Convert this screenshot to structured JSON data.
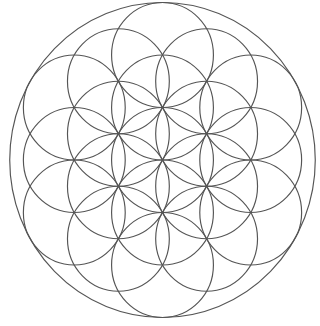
{
  "diagram": {
    "pattern": "19 overlapping circles in hexagonal arrangement enclosed by an outer circle",
    "center": [
      162.5,
      160
    ],
    "circle_radius": 52.5,
    "outer_radius": 157.5,
    "x_scale": 0.97,
    "stroke_color": "#555555",
    "stroke_width": 1.2,
    "background": "#ffffff",
    "circle_count": 19
  }
}
